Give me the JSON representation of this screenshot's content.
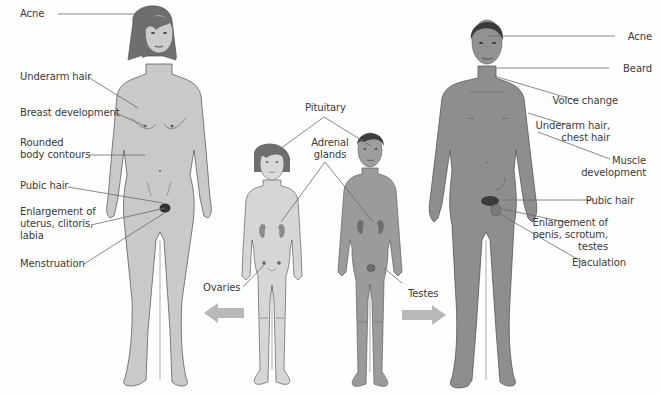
{
  "colors": {
    "background": "#fefefe",
    "female_adult_skin": "#c9c9c9",
    "male_adult_skin": "#8e8e8e",
    "girl_skin": "#d6d6d6",
    "boy_skin": "#9b9b9b",
    "outline": "#5e5e5e",
    "hair_dark": "#4a4a4a",
    "hair_female": "#6e6e6e",
    "leader_line": "#6a6a6a",
    "arrow": "#b8b8b8",
    "text": "#3a3a3a"
  },
  "figures": {
    "adult_female": "Adult female (post-puberty)",
    "girl": "Girl (pre-puberty)",
    "boy": "Boy (pre-puberty)",
    "adult_male": "Adult male (post-puberty)"
  },
  "labels": {
    "female": [
      {
        "id": "acne-f",
        "text": "Acne",
        "x": 20,
        "y": 8,
        "align": "left",
        "line": [
          [
            58,
            14
          ],
          [
            148,
            14
          ]
        ]
      },
      {
        "id": "underarm-hair-f",
        "text": "Underarm hair",
        "x": 20,
        "y": 71,
        "align": "left",
        "line": [
          [
            88,
            77
          ],
          [
            138,
            108
          ]
        ]
      },
      {
        "id": "breast-development",
        "text": "Breast development",
        "x": 20,
        "y": 107,
        "align": "left",
        "line": [
          [
            116,
            113
          ],
          [
            145,
            126
          ]
        ]
      },
      {
        "id": "rounded-body-contours",
        "text": "Rounded\nbody contours",
        "x": 20,
        "y": 137,
        "align": "left",
        "line": [
          [
            89,
            155
          ],
          [
            145,
            155
          ]
        ]
      },
      {
        "id": "pubic-hair-f",
        "text": "Pubic hair",
        "x": 20,
        "y": 180,
        "align": "left",
        "line": [
          [
            68,
            187
          ],
          [
            163,
            203
          ]
        ]
      },
      {
        "id": "enlargement-f",
        "text": "Enlargement of\nuterus, clitoris,\nlabia",
        "x": 20,
        "y": 206,
        "align": "left",
        "line": [
          [
            91,
            225
          ],
          [
            165,
            208
          ]
        ]
      },
      {
        "id": "menstruation",
        "text": "Menstruation",
        "x": 20,
        "y": 258,
        "align": "left",
        "line": [
          [
            84,
            264
          ],
          [
            166,
            212
          ]
        ]
      }
    ],
    "male": [
      {
        "id": "acne-m",
        "text": "Acne",
        "x": 618,
        "y": 31,
        "align": "right",
        "line": [
          [
            488,
            36
          ],
          [
            615,
            36
          ]
        ]
      },
      {
        "id": "beard",
        "text": "Beard",
        "x": 612,
        "y": 63,
        "align": "right",
        "line": [
          [
            497,
            68
          ],
          [
            609,
            68
          ]
        ]
      },
      {
        "id": "voice-change",
        "text": "Voice change",
        "x": 578,
        "y": 95,
        "align": "right",
        "line": [
          [
            494,
            76
          ],
          [
            578,
            101
          ]
        ]
      },
      {
        "id": "underarm-chest-hair",
        "text": "Underarm hair,\nchest hair",
        "x": 570,
        "y": 120,
        "align": "right",
        "line": [
          [
            528,
            113
          ],
          [
            570,
            126
          ]
        ]
      },
      {
        "id": "muscle-development",
        "text": "Muscle\ndevelopment",
        "x": 572,
        "y": 155,
        "align": "right",
        "line": [
          [
            538,
            132
          ],
          [
            610,
            159
          ]
        ]
      },
      {
        "id": "pubic-hair-m",
        "text": "Pubic hair",
        "x": 594,
        "y": 195,
        "align": "right",
        "line": [
          [
            503,
            200
          ],
          [
            594,
            200
          ]
        ]
      },
      {
        "id": "enlargement-m",
        "text": "Enlargement of\npenis, scrotum,\ntestes",
        "x": 568,
        "y": 217,
        "align": "right",
        "line": [
          [
            502,
            209
          ],
          [
            565,
            222
          ]
        ]
      },
      {
        "id": "ejaculation",
        "text": "Ejaculation",
        "x": 586,
        "y": 257,
        "align": "right",
        "line": [
          [
            498,
            213
          ],
          [
            584,
            263
          ]
        ]
      }
    ],
    "center": [
      {
        "id": "pituitary",
        "text": "Pituitary",
        "x": 305,
        "y": 102,
        "align": "center",
        "lines": [
          [
            [
              324,
              117
            ],
            [
              276,
              152
            ]
          ],
          [
            [
              324,
              117
            ],
            [
              371,
              146
            ]
          ]
        ]
      },
      {
        "id": "adrenal-glands",
        "text": "Adrenal\nglands",
        "x": 310,
        "y": 137,
        "align": "center",
        "lines": [
          [
            [
              325,
              162
            ],
            [
              281,
              222
            ]
          ],
          [
            [
              325,
              162
            ],
            [
              373,
              222
            ]
          ]
        ]
      },
      {
        "id": "ovaries",
        "text": "Ovaries",
        "x": 203,
        "y": 282,
        "align": "left",
        "line": [
          [
            243,
            287
          ],
          [
            265,
            264
          ]
        ]
      },
      {
        "id": "testes",
        "text": "Testes",
        "x": 408,
        "y": 288,
        "align": "left",
        "line": [
          [
            402,
            283
          ],
          [
            384,
            268
          ]
        ]
      }
    ]
  },
  "arrows": [
    {
      "id": "arrow-to-female",
      "direction": "left",
      "x": 204,
      "y": 303
    },
    {
      "id": "arrow-to-male",
      "direction": "right",
      "x": 402,
      "y": 305
    }
  ]
}
